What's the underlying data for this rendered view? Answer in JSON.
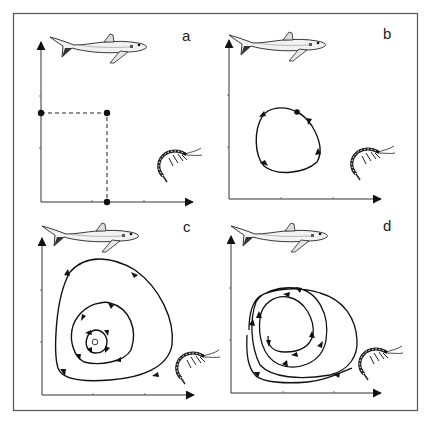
{
  "figure": {
    "frame_color": "#555555",
    "line_color": "#111111",
    "panels": [
      {
        "id": "a",
        "label": "a",
        "type": "equilibrium point with dashed projections",
        "predator_icon": "shark-icon",
        "prey_icon": "shrimp-icon"
      },
      {
        "id": "b",
        "label": "b",
        "type": "closed limit cycle (counter-clockwise)",
        "predator_icon": "shark-icon",
        "prey_icon": "shrimp-icon"
      },
      {
        "id": "c",
        "label": "c",
        "type": "stable spiral converging to equilibrium",
        "predator_icon": "shark-icon",
        "prey_icon": "shrimp-icon"
      },
      {
        "id": "d",
        "label": "d",
        "type": "unstable spiral diverging outward",
        "predator_icon": "shark-icon",
        "prey_icon": "shrimp-icon"
      }
    ],
    "axes": {
      "y_axis": "predator (shark) population",
      "x_axis": "prey (shrimp) population"
    }
  }
}
